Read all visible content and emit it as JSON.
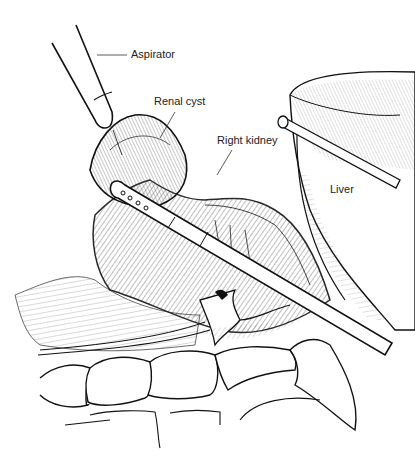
{
  "figure": {
    "type": "surgical line illustration",
    "labels": {
      "aspirator": "Aspirator",
      "renal_cyst": "Renal cyst",
      "right_kidney": "Right kidney",
      "liver": "Liver"
    },
    "colors": {
      "ink": "#111111",
      "background": "#ffffff",
      "label_text": "#222222"
    }
  }
}
